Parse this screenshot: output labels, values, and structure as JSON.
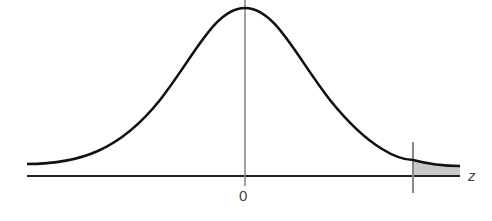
{
  "figure": {
    "type": "normal distribution curve with shaded right tail",
    "labels": {
      "center_tick": "0",
      "axis_variable": "z"
    },
    "colors": {
      "curve": "#111111",
      "axis": "#222222",
      "center_line": "#888888",
      "critical_line": "#888888",
      "shaded_tail": "#c8c8c8"
    },
    "shaded_region": "right tail beyond critical value"
  }
}
